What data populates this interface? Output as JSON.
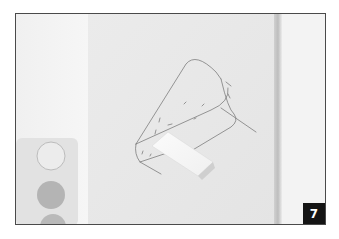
{
  "image": {
    "description": "Photo of a pencil sketch of a cone-shaped form on white paper, with a white eraser lying on it and a watercolor palette at the lower left",
    "step_number": "7",
    "colors": {
      "frame_border": "#4a4a4a",
      "paper": "#e8e8e8",
      "background_left": "#f2f2f2",
      "background_right": "#f4f4f4",
      "badge_bg": "#141414",
      "badge_text": "#ffffff",
      "pencil": "#6a6a6a"
    }
  }
}
